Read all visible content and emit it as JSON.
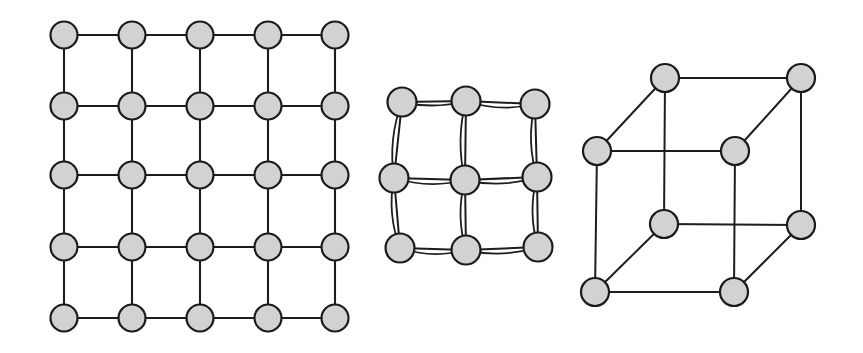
{
  "figure": {
    "background_color": "#ffffff",
    "node_fill_color": "#d2d2d2",
    "node_stroke_color": "#1a1a1a",
    "edge_color": "#1d1d1d",
    "node_radius": 13.5,
    "panels": [
      {
        "id": "square-lattice",
        "label": "5x5 square lattice",
        "node_count": 25,
        "edge_count": 40,
        "rows": 5,
        "cols": 5,
        "node_radius": 13.5,
        "xs": [
          64,
          132,
          200,
          268,
          335
        ],
        "ys": [
          35,
          106,
          175,
          247,
          318
        ]
      },
      {
        "id": "distorted-lattice",
        "label": "3x3 distorted lattice with doubled edges",
        "node_count": 9,
        "node_radius": 14.5,
        "nodes": [
          {
            "id": "a0",
            "x": 402,
            "y": 102
          },
          {
            "id": "a1",
            "x": 466,
            "y": 101
          },
          {
            "id": "a2",
            "x": 535,
            "y": 104
          },
          {
            "id": "b0",
            "x": 394,
            "y": 178
          },
          {
            "id": "b1",
            "x": 465,
            "y": 180
          },
          {
            "id": "b2",
            "x": 537,
            "y": 177
          },
          {
            "id": "c0",
            "x": 400,
            "y": 248
          },
          {
            "id": "c1",
            "x": 466,
            "y": 250
          },
          {
            "id": "c2",
            "x": 538,
            "y": 247
          }
        ],
        "edges": [
          {
            "from": "a0",
            "to": "a1",
            "bow": 4
          },
          {
            "from": "a1",
            "to": "a2",
            "bow": 5
          },
          {
            "from": "b0",
            "to": "b1",
            "bow": 5
          },
          {
            "from": "b1",
            "to": "b2",
            "bow": 5
          },
          {
            "from": "c0",
            "to": "c1",
            "bow": 5
          },
          {
            "from": "c1",
            "to": "c2",
            "bow": 5
          },
          {
            "from": "a0",
            "to": "b0",
            "bow": 5
          },
          {
            "from": "b0",
            "to": "c0",
            "bow": 5
          },
          {
            "from": "a1",
            "to": "b1",
            "bow": 5
          },
          {
            "from": "b1",
            "to": "c1",
            "bow": 5
          },
          {
            "from": "a2",
            "to": "b2",
            "bow": 5
          },
          {
            "from": "b2",
            "to": "c2",
            "bow": 5
          }
        ]
      },
      {
        "id": "cube-graph",
        "label": "cube graph (3-dimensional hypercube)",
        "node_count": 8,
        "edge_count": 12,
        "node_radius": 14,
        "nodes": [
          {
            "id": "back-top-left",
            "x": 665,
            "y": 78
          },
          {
            "id": "back-top-right",
            "x": 801,
            "y": 78
          },
          {
            "id": "front-top-left",
            "x": 597,
            "y": 151
          },
          {
            "id": "front-top-right",
            "x": 735,
            "y": 151
          },
          {
            "id": "back-bottom-left",
            "x": 664,
            "y": 224
          },
          {
            "id": "back-bottom-right",
            "x": 801,
            "y": 225
          },
          {
            "id": "front-bottom-left",
            "x": 595,
            "y": 292
          },
          {
            "id": "front-bottom-right",
            "x": 734,
            "y": 292
          }
        ],
        "edges": [
          {
            "from": "back-top-left",
            "to": "back-top-right"
          },
          {
            "from": "back-top-left",
            "to": "front-top-left"
          },
          {
            "from": "back-top-right",
            "to": "front-top-right"
          },
          {
            "from": "front-top-left",
            "to": "front-top-right"
          },
          {
            "from": "back-top-left",
            "to": "back-bottom-left"
          },
          {
            "from": "back-top-right",
            "to": "back-bottom-right"
          },
          {
            "from": "front-top-left",
            "to": "front-bottom-left"
          },
          {
            "from": "front-top-right",
            "to": "front-bottom-right"
          },
          {
            "from": "back-bottom-left",
            "to": "back-bottom-right"
          },
          {
            "from": "back-bottom-left",
            "to": "front-bottom-left"
          },
          {
            "from": "back-bottom-right",
            "to": "front-bottom-right"
          },
          {
            "from": "front-bottom-left",
            "to": "front-bottom-right"
          }
        ]
      }
    ]
  }
}
